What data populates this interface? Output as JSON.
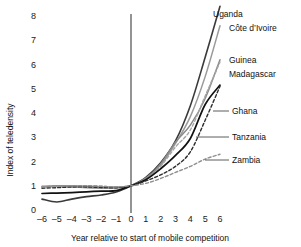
{
  "chart_data": {
    "type": "line",
    "title": "",
    "xlabel": "Year relative to start of mobile competition",
    "ylabel": "Index of teledensity",
    "xlim": [
      -6,
      6
    ],
    "ylim": [
      0,
      8
    ],
    "grid": false,
    "legend_position": "inline-right-end-labels",
    "x": [
      -6,
      -5,
      -4,
      -3,
      -2,
      -1,
      0,
      1,
      2,
      3,
      4,
      5,
      6
    ],
    "xticks": [
      "–6",
      "–5",
      "–4",
      "–3",
      "–2",
      "–1",
      "0",
      "1",
      "2",
      "3",
      "4",
      "5",
      "6"
    ],
    "yticks": [
      "0",
      "1",
      "2",
      "3",
      "4",
      "5",
      "6",
      "7",
      "8"
    ],
    "reference_line_x": 0,
    "series": [
      {
        "name": "Uganda",
        "style": "solid",
        "color": "#3a3a3a",
        "width": 1.6,
        "values": [
          0.45,
          0.33,
          0.45,
          0.55,
          0.62,
          0.74,
          1.0,
          1.35,
          1.95,
          2.85,
          4.3,
          6.3,
          8.4
        ]
      },
      {
        "name": "Côte d’Ivoire",
        "style": "solid",
        "color": "#9a9a9a",
        "width": 1.5,
        "values": [
          0.95,
          0.97,
          0.95,
          0.92,
          0.9,
          0.9,
          1.0,
          1.3,
          1.85,
          2.75,
          3.85,
          5.5,
          7.6
        ]
      },
      {
        "name": "Guinea",
        "style": "solid",
        "color": "#8a8a8a",
        "width": 1.5,
        "values": [
          0.98,
          1.0,
          1.0,
          0.98,
          0.95,
          0.95,
          1.0,
          1.3,
          1.9,
          2.8,
          3.5,
          4.6,
          6.2
        ]
      },
      {
        "name": "Madagascar",
        "style": "dashed",
        "color": "#a5a5a5",
        "width": 1.4,
        "values": [
          0.95,
          0.98,
          1.0,
          1.0,
          0.98,
          0.95,
          1.0,
          1.25,
          1.8,
          2.6,
          3.3,
          4.7,
          6.1
        ]
      },
      {
        "name": "Ghana",
        "style": "solid",
        "color": "#121212",
        "width": 1.7,
        "values": [
          0.68,
          0.7,
          0.72,
          0.75,
          0.78,
          0.8,
          1.0,
          1.25,
          1.7,
          2.25,
          2.95,
          4.35,
          5.15
        ]
      },
      {
        "name": "Tanzania",
        "style": "dashed",
        "color": "#2e2e2e",
        "width": 1.4,
        "values": [
          0.9,
          0.92,
          0.95,
          0.95,
          0.93,
          0.92,
          1.0,
          1.2,
          1.45,
          1.8,
          2.4,
          3.7,
          5.1
        ]
      },
      {
        "name": "Zambia",
        "style": "dashed",
        "color": "#8f8f8f",
        "width": 1.4,
        "values": [
          0.95,
          1.0,
          1.0,
          1.0,
          0.98,
          0.95,
          1.0,
          1.1,
          1.3,
          1.55,
          1.8,
          2.1,
          2.3
        ]
      }
    ],
    "annotations": [
      {
        "name": "Uganda",
        "leader": true
      },
      {
        "name": "Côte d’Ivoire",
        "leader": true
      },
      {
        "name": "Guinea",
        "leader": true
      },
      {
        "name": "Madagascar",
        "leader": true
      },
      {
        "name": "Ghana",
        "leader": true
      },
      {
        "name": "Tanzania",
        "leader": true
      },
      {
        "name": "Zambia",
        "leader": true
      }
    ]
  },
  "colors": {
    "axis": "#111111",
    "background": "#ffffff",
    "text": "#111111"
  }
}
